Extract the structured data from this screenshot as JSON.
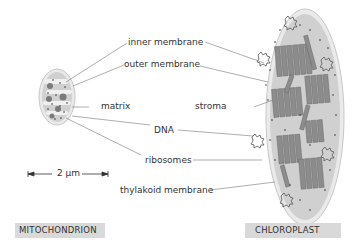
{
  "diagram": {
    "labels": {
      "inner_membrane": "inner membrane",
      "outer_membrane": "outer membrane",
      "matrix": "matrix",
      "stroma": "stroma",
      "dna": "DNA",
      "ribosomes": "ribosomes",
      "thylakoid_membrane": "thylakoid membrane"
    },
    "scale_bar": {
      "label": "2 µm"
    },
    "captions": {
      "left": "MITOCHONDRION",
      "right": "CHLOROPLAST"
    },
    "colors": {
      "membrane_fill": "#e9e9e9",
      "interior_fill": "#cfcfcf",
      "thylakoid_fill": "#8c8c8c",
      "caption_bg": "#d9d9d9",
      "leader_line": "#777777"
    }
  }
}
